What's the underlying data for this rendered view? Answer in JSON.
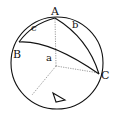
{
  "diagram": {
    "vertices": {
      "A": {
        "label": "A"
      },
      "B": {
        "label": "B"
      },
      "C": {
        "label": "C"
      }
    },
    "sides": {
      "a": {
        "label": "a"
      },
      "b": {
        "label": "b"
      },
      "c": {
        "label": "c"
      }
    },
    "symbol": "triangle-delta",
    "colors": {
      "stroke": "#111111",
      "background": "#ffffff"
    }
  }
}
